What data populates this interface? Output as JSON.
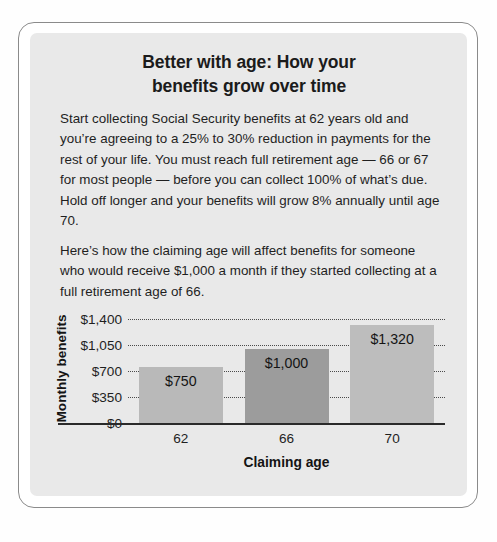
{
  "card": {
    "title_line1": "Better with age: How your",
    "title_line2": "benefits grow over time",
    "paragraph1": "Start collecting Social Security benefits at 62 years old and you’re agreeing to a 25% to 30% reduction in payments for the rest of your life. You must reach full retirement age — 66 or 67 for most people — before you can collect 100% of what’s due. Hold off longer and your benefits will grow 8% annually until age 70.",
    "paragraph2": "Here’s how the claiming age will affect benefits for someone who would receive $1,000 a month if they started collecting at a full retirement age of 66."
  },
  "chart_data": {
    "type": "bar",
    "title": "",
    "xlabel": "Claiming age",
    "ylabel": "Monthly benefits",
    "categories": [
      "62",
      "66",
      "70"
    ],
    "values": [
      750,
      1000,
      1320
    ],
    "value_labels": [
      "$750",
      "$1,000",
      "$1,320"
    ],
    "ylim": [
      0,
      1400
    ],
    "yticks": [
      1400,
      1050,
      700,
      350,
      0
    ],
    "ytick_labels": [
      "$1,400",
      "$1,050",
      "$700",
      "$350",
      "$0"
    ],
    "grid": true,
    "legend": "none",
    "bar_colors": [
      "#b9b9b9",
      "#9c9c9c",
      "#bdbdbd"
    ]
  },
  "colors": {
    "panel_background": "#e9e9e9",
    "card_border": "#8b8b8b",
    "text": "#1f1f1f",
    "axis": "#2a2a2a",
    "gridline": "#4a4a4a"
  }
}
